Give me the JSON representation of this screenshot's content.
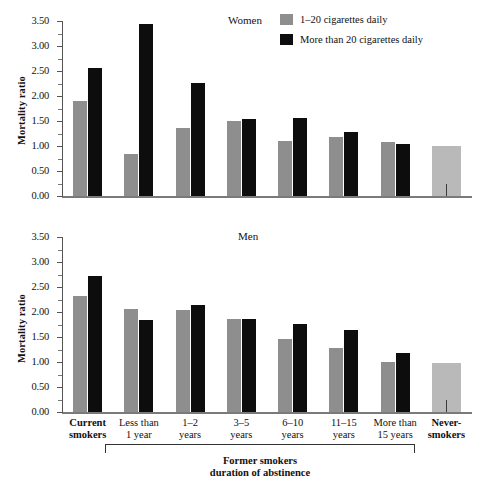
{
  "chart_data": [
    {
      "type": "bar",
      "title": "Women",
      "xlabel": "",
      "ylabel": "Mortality ratio",
      "ylim": [
        0,
        3.5
      ],
      "yticks": [
        "0.00",
        "0.50",
        "1.00",
        "1.50",
        "2.00",
        "2.50",
        "3.00",
        "3.50"
      ],
      "minor_tick_step": 0.25,
      "grid": false,
      "legend_position": "top-right",
      "categories": [
        "Current smokers",
        "Less than 1 year",
        "1–2 years",
        "3–5 years",
        "6–10 years",
        "11–15 years",
        "More than 15 years",
        "Never-smokers"
      ],
      "series": [
        {
          "name": "1–20 cigarettes daily",
          "values": [
            1.9,
            0.84,
            1.36,
            1.51,
            1.11,
            1.18,
            1.09,
            1.0
          ]
        },
        {
          "name": "More than 20 cigarettes daily",
          "values": [
            2.56,
            3.44,
            2.27,
            1.55,
            1.57,
            1.28,
            1.04,
            null
          ]
        }
      ]
    },
    {
      "type": "bar",
      "title": "Men",
      "xlabel": "",
      "ylabel": "Mortality ratio",
      "ylim": [
        0,
        3.5
      ],
      "yticks": [
        "0.00",
        "0.50",
        "1.00",
        "1.50",
        "2.00",
        "2.50",
        "3.00",
        "3.50"
      ],
      "minor_tick_step": 0.25,
      "grid": false,
      "legend_position": "none",
      "categories": [
        "Current smokers",
        "Less than 1 year",
        "1–2 years",
        "3–5 years",
        "6–10 years",
        "11–15 years",
        "More than 15 years",
        "Never-smokers"
      ],
      "series": [
        {
          "name": "1–20 cigarettes daily",
          "values": [
            2.33,
            2.07,
            2.05,
            1.86,
            1.46,
            1.28,
            1.0,
            0.99
          ]
        },
        {
          "name": "More than 20 cigarettes daily",
          "values": [
            2.72,
            1.85,
            2.14,
            1.87,
            1.77,
            1.65,
            1.18,
            null
          ]
        }
      ]
    }
  ],
  "legend": {
    "items": [
      {
        "label": "1–20 cigarettes daily",
        "color": "#8e8e8e"
      },
      {
        "label": "More than 20 cigarettes daily",
        "color": "#0d0d0d"
      }
    ]
  },
  "axis": {
    "ylabel": "Mortality ratio",
    "ticks": [
      "3.50",
      "3.00",
      "2.50",
      "2.00",
      "1.50",
      "1.00",
      "0.50",
      "0.00"
    ]
  },
  "titles": {
    "women": "Women",
    "men": "Men"
  },
  "categories": [
    {
      "line1": "Current",
      "line2": "smokers",
      "bold": true
    },
    {
      "line1": "Less than",
      "line2": "1 year",
      "bold": false
    },
    {
      "line1": "1–2",
      "line2": "years",
      "bold": false
    },
    {
      "line1": "3–5",
      "line2": "years",
      "bold": false
    },
    {
      "line1": "6–10",
      "line2": "years",
      "bold": false
    },
    {
      "line1": "11–15",
      "line2": "years",
      "bold": false
    },
    {
      "line1": "More than",
      "line2": "15 years",
      "bold": false
    },
    {
      "line1": "Never-",
      "line2": "smokers",
      "bold": true
    }
  ],
  "bracket": {
    "line1": "Former smokers",
    "line2": "duration of abstinence"
  },
  "colors": {
    "light_bar": "#8e8e8e",
    "dark_bar": "#0d0d0d",
    "never_bar": "#b9b9b9",
    "axis": "#555555",
    "text": "#111111"
  }
}
